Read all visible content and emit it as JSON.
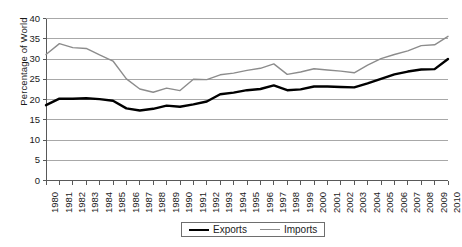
{
  "chart_data": {
    "type": "line",
    "title": "",
    "xlabel": "",
    "ylabel": "Percentage of World",
    "ylim": [
      0,
      40
    ],
    "ytick_step": 5,
    "yticks": [
      40,
      35,
      30,
      25,
      20,
      15,
      10,
      5,
      0
    ],
    "grid": true,
    "legend_position": "bottom-center",
    "x": [
      1980,
      1981,
      1982,
      1983,
      1984,
      1985,
      1986,
      1987,
      1988,
      1989,
      1990,
      1991,
      1992,
      1993,
      1994,
      1995,
      1996,
      1997,
      1998,
      1999,
      2000,
      2001,
      2002,
      2003,
      2004,
      2005,
      2006,
      2007,
      2008,
      2009,
      2010
    ],
    "categories": [
      "1980",
      "1981",
      "1982",
      "1983",
      "1984",
      "1985",
      "1986",
      "1987",
      "1988",
      "1989",
      "1990",
      "1991",
      "1992",
      "1993",
      "1994",
      "1995",
      "1996",
      "1997",
      "1998",
      "1999",
      "2000",
      "2001",
      "2002",
      "2003",
      "2004",
      "2005",
      "2006",
      "2007",
      "2008",
      "2009",
      "2010"
    ],
    "series": [
      {
        "name": "Exports",
        "color": "#000000",
        "width": 2.4,
        "values": [
          18.6,
          20.2,
          20.2,
          20.3,
          20.1,
          19.7,
          17.8,
          17.3,
          17.7,
          18.5,
          18.2,
          18.8,
          19.5,
          21.3,
          21.7,
          22.3,
          22.6,
          23.5,
          22.3,
          22.5,
          23.2,
          23.2,
          23.1,
          23.0,
          24.0,
          25.1,
          26.2,
          26.9,
          27.4,
          27.5,
          30.0
        ]
      },
      {
        "name": "Imports",
        "color": "#8c8c8c",
        "width": 1.4,
        "values": [
          31.1,
          33.8,
          32.8,
          32.6,
          31.0,
          29.5,
          25.1,
          22.6,
          21.8,
          22.8,
          22.2,
          25.0,
          24.9,
          26.1,
          26.5,
          27.2,
          27.7,
          28.8,
          26.2,
          26.8,
          27.6,
          27.3,
          27.0,
          26.6,
          28.5,
          30.1,
          31.1,
          32.0,
          33.3,
          33.5,
          35.6
        ]
      }
    ],
    "legend": [
      "Exports",
      "Imports"
    ],
    "axis_color": "#595959",
    "grid_color": "#9e9e9e"
  }
}
